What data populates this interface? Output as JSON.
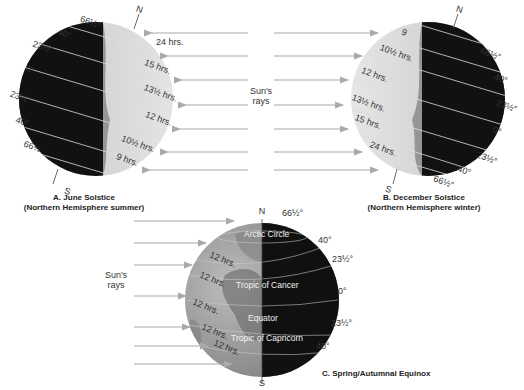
{
  "panels": [
    {
      "id": "A",
      "caption_title": "A. June Solstice",
      "caption_sub": "(Northern Hemisphere summer)",
      "north": "N",
      "south": "S",
      "latitudes": [
        "66½°",
        "40°",
        "23½°",
        "0°",
        "23½°",
        "40°",
        "66½"
      ],
      "daylengths": [
        "24 hrs.",
        "15 hrs.",
        "13½ hrs.",
        "12 hrs.",
        "10½ hrs.",
        "9 hrs."
      ]
    },
    {
      "id": "B",
      "caption_title": "B. December Solstice",
      "caption_sub": "(Northern Hemisphere winter)",
      "north": "N",
      "south": "S",
      "latitudes": [
        "66½°",
        "40°",
        "23½°",
        "0°",
        "23½°",
        "40°",
        "66½°"
      ],
      "daylengths": [
        "9",
        "10½ hrs.",
        "12 hrs.",
        "13½ hrs.",
        "15 hrs.",
        "24 hrs."
      ]
    },
    {
      "id": "C",
      "caption_title": "C. Spring/Autumnal Equinox",
      "north": "N",
      "south": "S",
      "latitudes": [
        "66½°",
        "40°",
        "23½°",
        "0°",
        "23½°",
        "40°"
      ],
      "circle_names": [
        "Arctic Circle",
        "Tropic of Cancer",
        "Equator",
        "Tropic of Capricorn"
      ],
      "daylengths": [
        "12 hrs.",
        "12 hrs.",
        "12 hrs.",
        "12 hrs.",
        "12 hrs."
      ]
    }
  ],
  "sun_rays_label_top": [
    "Sun's",
    "rays"
  ],
  "sun_rays_label_bottom": [
    "Sun's",
    "rays"
  ],
  "colors": {
    "night": "#111111",
    "day": "#d8d8d8",
    "ray": "#b0b0b0",
    "text": "#333333"
  }
}
